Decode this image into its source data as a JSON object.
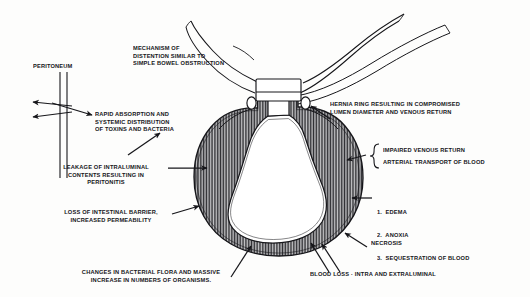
{
  "figure": {
    "background_color": "#fdfdfc",
    "ink_color": "#16161a",
    "wall_hatch_color": "#3a3a3a",
    "lumen_color": "#ffffff"
  },
  "labels": {
    "peritoneum": "PERITONEUM",
    "mechanism": "MECHANISM OF\nDISTENTION SIMILAR TO\nSIMPLE BOWEL OBSTRUCTION",
    "rapid_absorption": "RAPID ABSORPTION AND\nSYSTEMIC DISTRIBUTION\nOF TOXINS AND BACTERIA",
    "leakage": "LEAKAGE OF INTRALUMINAL\nCONTENTS RESULTING IN\nPERITONITIS",
    "loss_barrier": "LOSS OF INTESTINAL BARRIER,\nINCREASED PERMEABILITY",
    "bacterial_flora": "CHANGES IN BACTERIAL FLORA AND MASSIVE\nINCREASE IN NUMBERS OF ORGANISMS.",
    "hernia_ring": "HERNIA RING RESULTING IN COMPROMISED\nLUMEN DIAMETER AND VENOUS RETURN",
    "impaired_venous": "IMPAIRED VENOUS RETURN",
    "arterial_transport": "ARTERIAL TRANSPORT OF BLOOD",
    "necrosis": "NECROSIS",
    "blood_loss": "BLOOD LOSS · INTRA AND EXTRALUMINAL",
    "sequelae": [
      "1.  EDEMA",
      "2.  ANOXIA",
      "3.  SEQUESTRATION OF BLOOD"
    ]
  }
}
